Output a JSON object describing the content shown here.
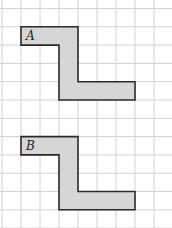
{
  "grid": {
    "origin_x": 2,
    "origin_y": 8.5,
    "cell_w": 19,
    "cell_h": 18.3,
    "cols": 9,
    "rows": 12,
    "line_color": "#d2d2d2"
  },
  "shapes": [
    {
      "label": "A",
      "fill": "#d6d6d6",
      "stroke": "#2b2b2b",
      "cells_outline": [
        [
          1,
          1
        ],
        [
          4,
          1
        ],
        [
          4,
          4
        ],
        [
          7,
          4
        ],
        [
          7,
          5
        ],
        [
          3,
          5
        ],
        [
          3,
          2
        ],
        [
          1,
          2
        ]
      ],
      "label_cell": [
        1,
        1
      ]
    },
    {
      "label": "B",
      "fill": "#d6d6d6",
      "stroke": "#2b2b2b",
      "cells_outline": [
        [
          1,
          7
        ],
        [
          4,
          7
        ],
        [
          4,
          10
        ],
        [
          7,
          10
        ],
        [
          7,
          11
        ],
        [
          3,
          11
        ],
        [
          3,
          8
        ],
        [
          1,
          8
        ]
      ],
      "label_cell": [
        1,
        7
      ]
    }
  ]
}
